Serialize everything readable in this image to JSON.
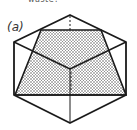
{
  "figure": {
    "top_cut_text": "waste?",
    "panel_label": "(a)",
    "colors": {
      "stroke": "#1a1a1a",
      "fill_dots": "#444444",
      "background": "#ffffff"
    }
  }
}
